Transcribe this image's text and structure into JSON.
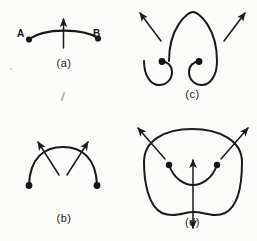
{
  "figure": {
    "background_color": "#fbfbfa",
    "ink_color": "#1a1a1a",
    "panel_count": 4
  },
  "panels": [
    {
      "id": "a",
      "caption": "(a)",
      "description": "Open arc from endpoint A to endpoint B with a single upward normal arrow at the midpoint",
      "endpoint_labels": [
        "A",
        "B"
      ],
      "endpoint_dots": 2,
      "arrows": [
        {
          "name": "normal-arrow-up",
          "direction": "up",
          "double_headed": false
        }
      ]
    },
    {
      "id": "b",
      "caption": "(b)",
      "description": "Open arc with two endpoint dots and two crossing arrows pointing outward",
      "endpoint_labels": [],
      "endpoint_dots": 2,
      "arrows": [
        {
          "name": "normal-arrow-up-left",
          "direction": "up-left",
          "double_headed": false
        },
        {
          "name": "normal-arrow-up-right",
          "direction": "up-right",
          "double_headed": false
        }
      ]
    },
    {
      "id": "c",
      "caption": "(c)",
      "description": "Curve whose two ends spiral inward to dots, with two arrows crossing the upper arcs",
      "endpoint_labels": [],
      "endpoint_dots": 2,
      "arrows": [
        {
          "name": "normal-arrow-up-left",
          "direction": "up-left",
          "double_headed": false
        },
        {
          "name": "normal-arrow-up-right",
          "direction": "up-right",
          "double_headed": false
        }
      ]
    },
    {
      "id": "d",
      "caption": "(d)",
      "description": "Closed blob curve with two outward arrows crossing the top, an inner arc joining two dots, and a vertical double-headed arrow through the interior and lower boundary",
      "endpoint_labels": [],
      "endpoint_dots": 2,
      "arrows": [
        {
          "name": "normal-arrow-up-left",
          "direction": "up-left",
          "double_headed": false
        },
        {
          "name": "normal-arrow-up-right",
          "direction": "up-right",
          "double_headed": false
        },
        {
          "name": "normal-arrow-vertical",
          "direction": "up-and-down",
          "double_headed": true
        }
      ]
    }
  ]
}
